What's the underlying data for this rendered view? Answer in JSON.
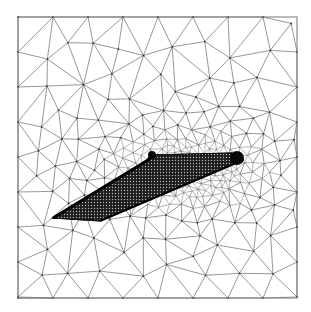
{
  "figure": {
    "type": "triangular-mesh",
    "frame": {
      "x": 18,
      "y": 17,
      "width": 279,
      "height": 281
    },
    "colors": {
      "background": "#ffffff",
      "mesh": "#6a6a6a",
      "wing": "#111111",
      "frame": "#777777"
    },
    "wing": {
      "outline": [
        [
          53,
          218
        ],
        [
          100,
          221
        ],
        [
          243,
          160
        ],
        [
          232,
          153
        ],
        [
          152,
          155
        ],
        [
          148,
          160
        ]
      ],
      "root_blob": {
        "cx": 237,
        "cy": 158,
        "r": 7
      },
      "tip_blob": {
        "cx": 152,
        "cy": 155,
        "r": 4
      }
    },
    "refinement_zone": {
      "cx": 190,
      "cy": 170,
      "rx": 70,
      "ry": 35
    }
  }
}
